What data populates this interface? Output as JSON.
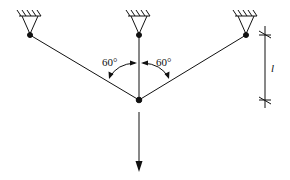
{
  "diagram": {
    "type": "three-bar truss / suspended load",
    "colors": {
      "stroke": "#111111",
      "background": "#ffffff"
    },
    "supports": [
      {
        "id": "left",
        "kind": "pinned",
        "x": 30,
        "y": 35
      },
      {
        "id": "center",
        "kind": "pinned",
        "x": 139,
        "y": 35
      },
      {
        "id": "right",
        "kind": "pinned",
        "x": 246,
        "y": 35
      }
    ],
    "joint": {
      "x": 139,
      "y": 100
    },
    "bars": [
      {
        "from": "left",
        "to": "joint"
      },
      {
        "from": "center",
        "to": "joint"
      },
      {
        "from": "right",
        "to": "joint"
      }
    ],
    "angles": [
      {
        "label": "60°",
        "side": "left"
      },
      {
        "label": "60°",
        "side": "right"
      }
    ],
    "load": {
      "direction": "down",
      "from_y": 112,
      "to_y": 170
    },
    "dimension": {
      "label": "l",
      "x": 265,
      "top_y": 35,
      "bottom_y": 100
    }
  }
}
